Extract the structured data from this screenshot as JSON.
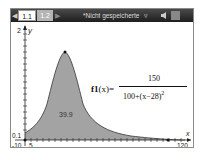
{
  "titlebar": {
    "tabs": [
      {
        "label": "1.1",
        "active": true
      },
      {
        "label": "1.2",
        "active": false
      }
    ],
    "document_title": "*Nicht gespeicherte",
    "icons": [
      "nav-left-icon",
      "nav-right-icon",
      "menu-dropdown-icon",
      "battery-icon"
    ]
  },
  "graph": {
    "x_axis": {
      "min_label": "-10",
      "tick_label": "5",
      "max_label": "120",
      "name": "x"
    },
    "y_axis": {
      "max_label": "2",
      "min_label": "0.1",
      "name": "y"
    },
    "function": {
      "name": "f1",
      "arg": "(x)",
      "equals": "=",
      "numerator": "150",
      "denominator": "100+(x−28)",
      "exponent": "2"
    },
    "area_label": "39.9",
    "colors": {
      "fill": "#a3a3a3",
      "curve": "#333333"
    }
  }
}
